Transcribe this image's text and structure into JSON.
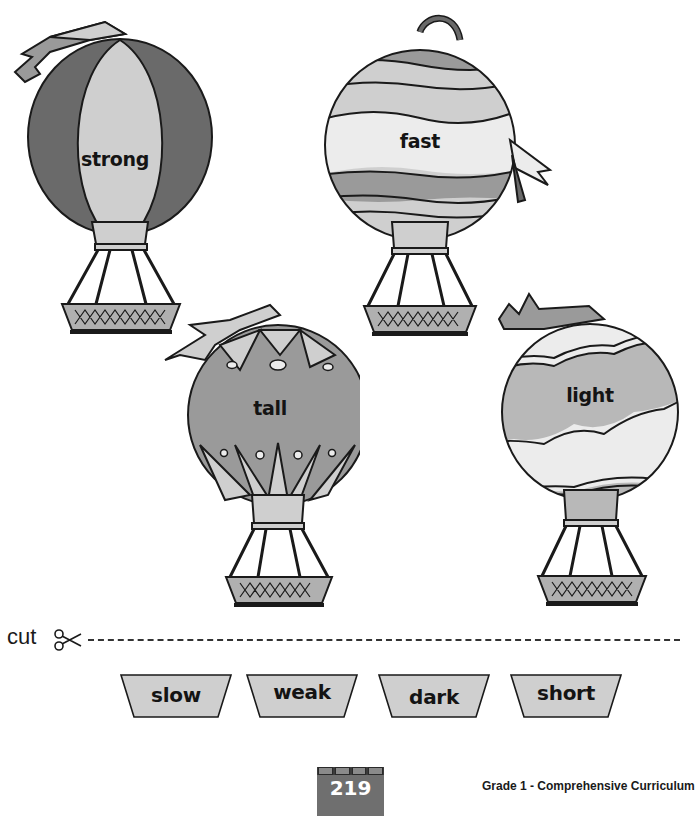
{
  "worksheet": {
    "balloons": [
      {
        "id": "strong",
        "word": "strong",
        "pattern": "vertical-gores"
      },
      {
        "id": "fast",
        "word": "fast",
        "pattern": "wavy-stripes"
      },
      {
        "id": "tall",
        "word": "tall",
        "pattern": "leaf-motif"
      },
      {
        "id": "light",
        "word": "light",
        "pattern": "clouds"
      }
    ],
    "cut": {
      "label": "cut",
      "icon": "scissors-icon"
    },
    "word_cards": [
      "slow",
      "weak",
      "dark",
      "short"
    ],
    "footer": {
      "page_number": "219",
      "book_title": "Grade 1 - Comprehensive Curriculum"
    },
    "colors": {
      "dark_gray": "#6a6a6a",
      "mid_gray": "#9a9a9a",
      "light_gray": "#cfcfcf",
      "pale": "#ececec",
      "outline": "#1a1a1a"
    }
  }
}
